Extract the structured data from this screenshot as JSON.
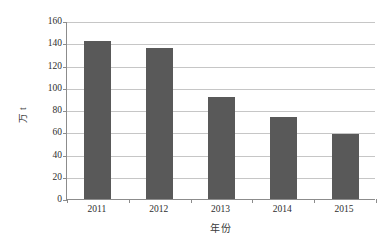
{
  "chart_data": {
    "type": "bar",
    "title": "",
    "subtitle": "",
    "categories": [
      "2011",
      "2012",
      "2013",
      "2014",
      "2015"
    ],
    "values": [
      142,
      135.5,
      91.5,
      73.5,
      58.5
    ],
    "series": [
      {
        "name": "",
        "values": [
          142,
          135.5,
          91.5,
          73.5,
          58.5
        ]
      }
    ],
    "xlabel": "年份",
    "ylabel": "万 t",
    "ylim": [
      0,
      160
    ],
    "ytick_labels": [
      "0",
      "20",
      "40",
      "60",
      "80",
      "100",
      "120",
      "140",
      "160"
    ],
    "ytick_values": [
      0,
      20,
      40,
      60,
      80,
      100,
      120,
      140,
      160
    ],
    "xtick_labels": [
      "2011",
      "2012",
      "2013",
      "2014",
      "2015"
    ],
    "grid": "horizontal",
    "legend": "none",
    "bar_color": "#595959",
    "gridline_color": "#c6c6c6",
    "axis_color": "#8c8c8c",
    "background_color": "#ffffff"
  }
}
